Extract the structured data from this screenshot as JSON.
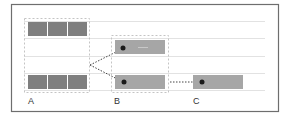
{
  "diagram": {
    "colors": {
      "frame_border": "#6e6e6e",
      "grid_line": "#e2e2e2",
      "dashed_box": "#c4c4c4",
      "bar_dark": "#7f7f7f",
      "bar_light": "#a6a6a6",
      "dot": "#1a1a1a",
      "connector": "#444444"
    },
    "groups": [
      {
        "id": "A",
        "label": "A",
        "rows": 2,
        "bars_per_row": 3
      },
      {
        "id": "B",
        "label": "B",
        "rows": 2,
        "bars_per_row": 1
      },
      {
        "id": "C",
        "label": "C",
        "rows": 1,
        "bars_per_row": 1
      }
    ],
    "connectors": [
      {
        "from": "A",
        "to": "B-top",
        "style": "dotted"
      },
      {
        "from": "A",
        "to": "B-bottom",
        "style": "dotted"
      },
      {
        "from": "B-bottom",
        "to": "C",
        "style": "dotted"
      }
    ]
  }
}
